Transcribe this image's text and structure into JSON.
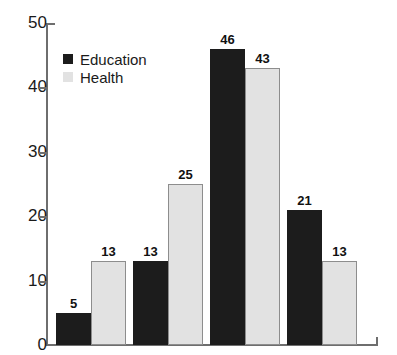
{
  "chart_data": {
    "type": "bar",
    "title": "",
    "subtitle": "",
    "xlabel": "",
    "ylabel": "",
    "ylim": [
      0,
      50
    ],
    "yticks": [
      0,
      10,
      20,
      30,
      40,
      50
    ],
    "ytick_labels": [
      "0",
      "10",
      "20",
      "30",
      "40",
      "50"
    ],
    "grid": false,
    "legend_position": "upper-left-inside",
    "categories": [
      "",
      "",
      "",
      ""
    ],
    "xtick_labels": [],
    "series": [
      {
        "name": "Education",
        "color": "#1c1c1c",
        "values": [
          5,
          13,
          46,
          21
        ],
        "value_labels": [
          "5",
          "13",
          "46",
          "21"
        ]
      },
      {
        "name": "Health",
        "color": "#e2e2e2",
        "values": [
          13,
          25,
          43,
          13
        ],
        "value_labels": [
          "13",
          "25",
          "43",
          "13"
        ]
      }
    ]
  },
  "legend": {
    "items": [
      {
        "label": "Education",
        "swatch": "education"
      },
      {
        "label": "Health",
        "swatch": "health"
      }
    ]
  },
  "axis": {
    "y_labels": [
      "50",
      "40",
      "30",
      "20",
      "10",
      "0"
    ]
  }
}
